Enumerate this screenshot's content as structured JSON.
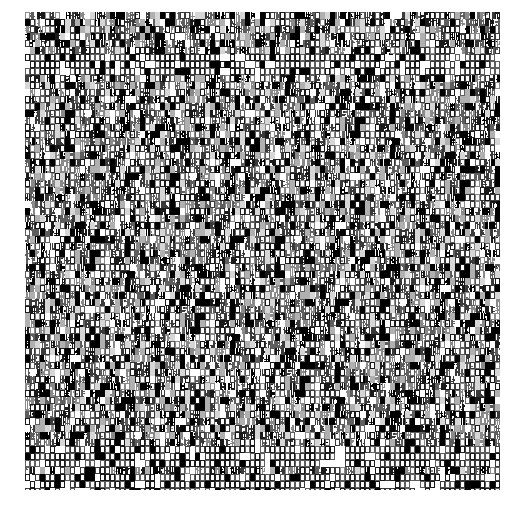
{
  "image": {
    "description": "Dense field of overlapping, illegible tiny glyphs (box/tofu-like characters) in grayscale on white; no readable text or UI controls visible.",
    "width": 521,
    "height": 510,
    "background_color": "#ffffff"
  },
  "noise_field": {
    "bounds": {
      "x": 25,
      "y": 12,
      "width": 475,
      "height": 478
    },
    "palette": [
      "#000000",
      "#1a1a1a",
      "#3a3a3a",
      "#5e5e5e",
      "#8a8a8a",
      "#b0b0b0",
      "#d6d6d6",
      "#ffffff"
    ],
    "glyph_cell": {
      "width": 5,
      "height": 7
    },
    "lighter_bands_y": [
      62,
      455,
      478
    ],
    "legible_text": []
  }
}
